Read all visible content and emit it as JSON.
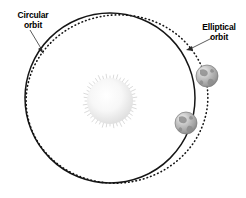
{
  "figure": {
    "background_color": "#ffffff",
    "width": 246,
    "height": 198
  },
  "labels": {
    "circular": {
      "line1": "Circular",
      "line2": "orbit",
      "color": "#000000",
      "anchor_x": 33,
      "anchor_y": 18,
      "align": "middle"
    },
    "elliptical": {
      "line1": "Elliptical",
      "line2": "orbit",
      "color": "#000000",
      "anchor_x": 219,
      "anchor_y": 30,
      "align": "middle"
    }
  },
  "orbits": {
    "circular": {
      "name": "Circular orbit",
      "style": "solid",
      "stroke_color": "#151515",
      "stroke_width": 1.5,
      "center_x": 110,
      "center_y": 98,
      "radius": 85
    },
    "elliptical": {
      "name": "Elliptical orbit",
      "style": "dotted",
      "stroke_color": "#151515",
      "stroke_width": 1.6,
      "center_x": 117,
      "center_y": 99,
      "radius_x": 91,
      "radius_y": 84,
      "rotation_deg": -8
    }
  },
  "sun": {
    "name": "Sun",
    "center_x": 110,
    "center_y": 101,
    "radius": 23,
    "core_color": "#fbfbfb",
    "edge_color": "#e2e2e2",
    "ray_color": "#d6d6d6",
    "ray_count": 44
  },
  "planets": [
    {
      "name": "planet-upper",
      "center_x": 207,
      "center_y": 76,
      "radius": 11,
      "body_color": "#b9b9b9",
      "shadow_color": "#8d8d8d",
      "highlight_color": "#efefef",
      "continent_color": "#8a8a8a"
    },
    {
      "name": "planet-lower",
      "center_x": 186,
      "center_y": 123,
      "radius": 11,
      "body_color": "#b9b9b9",
      "shadow_color": "#8d8d8d",
      "highlight_color": "#efefef",
      "continent_color": "#8a8a8a"
    }
  ],
  "leaders": [
    {
      "name": "leader-circular",
      "from_x": 30,
      "from_y": 30,
      "to_x": 44,
      "to_y": 53,
      "color": "#4a4a4a"
    },
    {
      "name": "leader-elliptical",
      "from_x": 212,
      "from_y": 38,
      "to_x": 187,
      "to_y": 50,
      "color": "#4a4a4a"
    }
  ]
}
